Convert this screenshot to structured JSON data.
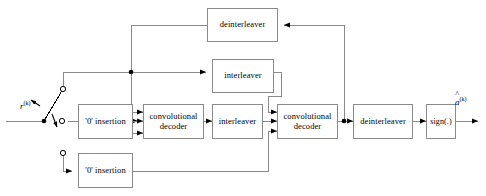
{
  "diagram": {
    "colors": {
      "box_border": "#8a8a8a",
      "wire": "#808080",
      "node": "#000000",
      "background": "#ffffff",
      "text": "#000000"
    },
    "input": {
      "signal_label": "r",
      "signal_superscript": "(k)",
      "switch_name": "input-demux-switch"
    },
    "output": {
      "signal_label": "a",
      "signal_superscript": "(k)",
      "signal_accent": "hat"
    },
    "blocks": [
      {
        "id": "deinterleaver-top",
        "label": "deinterleaver",
        "x": 207,
        "y": 8,
        "w": 71,
        "h": 34
      },
      {
        "id": "interleaver-upper",
        "label": "interleaver",
        "x": 212,
        "y": 59,
        "w": 62,
        "h": 34
      },
      {
        "id": "zero-insertion-upper",
        "label": "'0' insertion",
        "x": 78,
        "y": 104,
        "w": 55,
        "h": 35
      },
      {
        "id": "convolutional-decoder-1",
        "label": "convolutional\ndecoder",
        "x": 143,
        "y": 104,
        "w": 61,
        "h": 35
      },
      {
        "id": "interleaver-lower",
        "label": "interleaver",
        "x": 212,
        "y": 104,
        "w": 51,
        "h": 35
      },
      {
        "id": "convolutional-decoder-2",
        "label": "convolutional\ndecoder",
        "x": 277,
        "y": 104,
        "w": 61,
        "h": 35
      },
      {
        "id": "deinterleaver-output",
        "label": "deinterleaver",
        "x": 353,
        "y": 104,
        "w": 60,
        "h": 35
      },
      {
        "id": "sign-function",
        "label": "sign(.)",
        "x": 426,
        "y": 104,
        "w": 30,
        "h": 35
      },
      {
        "id": "zero-insertion-lower",
        "label": "'0' insertion",
        "x": 78,
        "y": 153,
        "w": 55,
        "h": 35
      }
    ],
    "junctions": [
      {
        "id": "branch-node-upper",
        "x": 131,
        "y": 72
      },
      {
        "id": "branch-node-output",
        "x": 344,
        "y": 121
      }
    ],
    "terminals": [
      {
        "id": "switch-terminal-upper",
        "x": 63,
        "y": 89
      },
      {
        "id": "switch-terminal-middle",
        "x": 68,
        "y": 121
      },
      {
        "id": "switch-terminal-lower",
        "x": 63,
        "y": 153
      }
    ]
  }
}
